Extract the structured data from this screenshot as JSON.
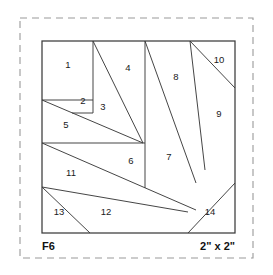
{
  "document": {
    "title": "F6",
    "pattern_type": "foundation-paper-piecing-block",
    "block_label": "F6",
    "size_label": "2\" x 2\"",
    "finished_size_inches": {
      "width": 2,
      "height": 2
    },
    "piece_count": 14
  },
  "colors": {
    "background": "#ffffff",
    "seam_line": "#3b3b3b",
    "block_outline": "#3b3b3b",
    "cut_border_dashed": "#9a9a9a",
    "number_text": "#1a1a1a",
    "label_text": "#111111"
  },
  "canvas": {
    "width": 273,
    "height": 275
  },
  "cut_border": {
    "name": "seam-allowance-dashed-border",
    "x": 20,
    "y": 18,
    "width": 233,
    "height": 240,
    "dash": "7 5"
  },
  "block": {
    "name": "block-outline",
    "x": 42,
    "y": 41,
    "width": 193,
    "height": 192
  },
  "pieces": [
    {
      "n": "1",
      "label_x": 68,
      "label_y": 65
    },
    {
      "n": "2",
      "label_x": 83,
      "label_y": 101
    },
    {
      "n": "3",
      "label_x": 103,
      "label_y": 107
    },
    {
      "n": "4",
      "label_x": 128,
      "label_y": 68
    },
    {
      "n": "5",
      "label_x": 66,
      "label_y": 125
    },
    {
      "n": "6",
      "label_x": 131,
      "label_y": 161
    },
    {
      "n": "7",
      "label_x": 169,
      "label_y": 157
    },
    {
      "n": "8",
      "label_x": 176,
      "label_y": 77
    },
    {
      "n": "9",
      "label_x": 219,
      "label_y": 114
    },
    {
      "n": "10",
      "label_x": 219,
      "label_y": 60
    },
    {
      "n": "11",
      "label_x": 71,
      "label_y": 173
    },
    {
      "n": "12",
      "label_x": 106,
      "label_y": 212
    },
    {
      "n": "13",
      "label_x": 59,
      "label_y": 212
    },
    {
      "n": "14",
      "label_x": 210,
      "label_y": 212
    }
  ],
  "seam_lines": [
    {
      "name": "seam-1-2-horizontal",
      "x1": 42,
      "y1": 100,
      "x2": 93,
      "y2": 100
    },
    {
      "name": "seam-1-3-vertical",
      "x1": 93,
      "y1": 41,
      "x2": 93,
      "y2": 113
    },
    {
      "name": "seam-2-3-horizontal",
      "x1": 93,
      "y1": 113,
      "x2": 72,
      "y2": 113
    },
    {
      "name": "seam-2-5-diagonal",
      "x1": 42,
      "y1": 100,
      "x2": 143,
      "y2": 143
    },
    {
      "name": "seam-3-4-diagonal",
      "x1": 93,
      "y1": 41,
      "x2": 143,
      "y2": 143
    },
    {
      "name": "seam-4-8-vertical",
      "x1": 145,
      "y1": 41,
      "x2": 145,
      "y2": 188
    },
    {
      "name": "seam-5-11-horizontal",
      "x1": 42,
      "y1": 143,
      "x2": 145,
      "y2": 143
    },
    {
      "name": "seam-8-7-diagonal",
      "x1": 145,
      "y1": 41,
      "x2": 196,
      "y2": 183
    },
    {
      "name": "seam-8-9-diagonal",
      "x1": 190,
      "y1": 41,
      "x2": 205,
      "y2": 170
    },
    {
      "name": "seam-9-10-diagonal",
      "x1": 190,
      "y1": 41,
      "x2": 235,
      "y2": 88
    },
    {
      "name": "seam-11-12-diagonal",
      "x1": 42,
      "y1": 143,
      "x2": 196,
      "y2": 210
    },
    {
      "name": "seam-12-13-diagonal",
      "x1": 42,
      "y1": 187,
      "x2": 188,
      "y2": 212
    },
    {
      "name": "seam-13-edge",
      "x1": 42,
      "y1": 187,
      "x2": 90,
      "y2": 233
    },
    {
      "name": "seam-14-diagonal",
      "x1": 188,
      "y1": 233,
      "x2": 235,
      "y2": 183
    }
  ]
}
